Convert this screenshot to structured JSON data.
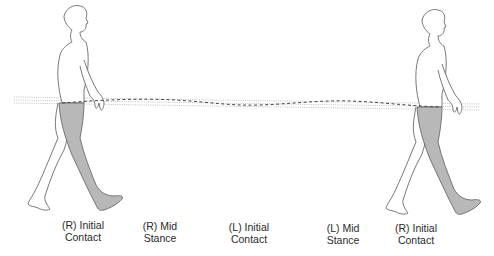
{
  "diagram": {
    "colors": {
      "outline": "#6a6a6a",
      "leg_fill": "#b8b8b8",
      "reference_lines": "#b0b0b0",
      "com_path": "#444444",
      "text": "#2a2a2a"
    },
    "figures": [
      {
        "id": "left-walker",
        "phase": "(R) Initial Contact",
        "shaded_limb": "right leg"
      },
      {
        "id": "right-walker",
        "phase": "(R) Initial Contact",
        "shaded_limb": "right leg"
      }
    ],
    "lines": {
      "reference": "dotted horizontal reference lines (upper / lower bounds)",
      "com_path": "dashed sinusoidal path of center of mass"
    }
  },
  "phases": [
    {
      "line1": "(R) Initial",
      "line2": "Contact"
    },
    {
      "line1": "(R) Mid",
      "line2": "Stance"
    },
    {
      "line1": "(L) Initial",
      "line2": "Contact"
    },
    {
      "line1": "(L) Mid",
      "line2": "Stance"
    },
    {
      "line1": "(R) Initial",
      "line2": "Contact"
    }
  ]
}
